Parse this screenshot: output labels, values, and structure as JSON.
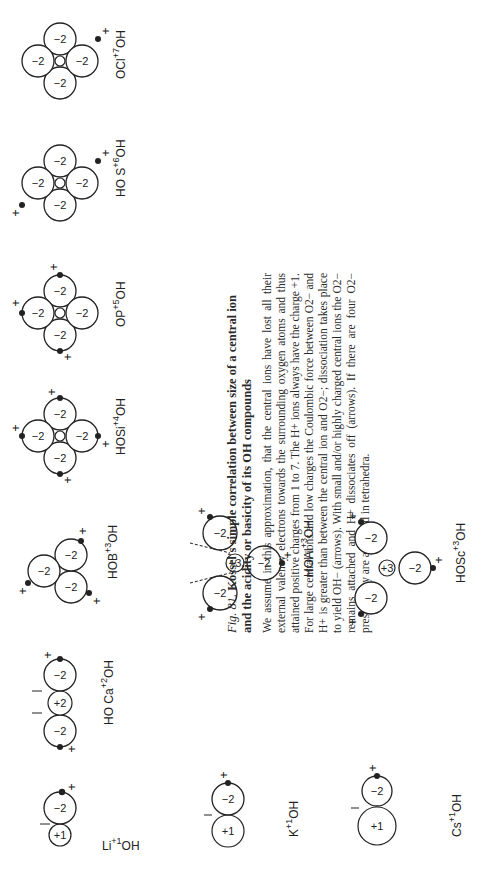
{
  "figure": {
    "label": "Fig. 81.",
    "title": "Kossel's simple correlation between size of a central ion and the acidity or basicity of its OH compounds",
    "body": "We assume in this approximation, that the central ions have lost all their external valency electrons towards the surrounding oxygen atoms and thus attained positive charges from 1 to 7. The H+ ions always have the charge +1. For large central ions and low charges the Coulombic force between O2− and H+ is greater than between the central ion and O2−; dissociation takes place to yield OH− (arrows). With small and/or highly charged central ions the O2− remains attached and H+ dissociates off (arrows). If there are four O2− present they are arranged in tetrahedra."
  },
  "molecules": [
    {
      "id": "li",
      "formula": "Li",
      "charge": "+1",
      "suffix": "OH",
      "central_charge": "+1",
      "oxygen_charge": "−2"
    },
    {
      "id": "ca",
      "formula": "HO Ca",
      "charge": "+2",
      "suffix": "OH",
      "central_charge": "+2",
      "oxygen_charge": "−2"
    },
    {
      "id": "b",
      "formula": "HO B(OH) OH",
      "charge": "+3",
      "central_charge": "+3",
      "oxygen_charge": "−2"
    },
    {
      "id": "si",
      "formula": "HO Si(OH)2 OH",
      "charge": "+4",
      "central_charge": "+4",
      "oxygen_charge": "−2"
    },
    {
      "id": "p",
      "formula": "O P(OH)3",
      "charge": "+5",
      "central_charge": "+5",
      "oxygen_charge": "−2"
    },
    {
      "id": "s",
      "formula": "HO S(O)2 OH",
      "charge": "+6",
      "central_charge": "+6",
      "oxygen_charge": "−2"
    },
    {
      "id": "cl",
      "formula": "O Cl(O)2 OH",
      "charge": "+7",
      "central_charge": "+7",
      "oxygen_charge": "−2"
    },
    {
      "id": "k",
      "formula": "K",
      "charge": "+1",
      "suffix": "OH",
      "central_charge": "+1",
      "oxygen_charge": "−2"
    },
    {
      "id": "al",
      "formula": "HO Al(OH) OH",
      "charge": "+3",
      "central_charge": "+3",
      "oxygen_charge": "−2"
    },
    {
      "id": "cs",
      "formula": "Cs",
      "charge": "+1",
      "suffix": "OH",
      "central_charge": "+1",
      "oxygen_charge": "−2"
    },
    {
      "id": "sc",
      "formula": "HO Sc(OH) OH",
      "charge": "+3",
      "central_charge": "+3",
      "oxygen_charge": "−2"
    }
  ],
  "labels": {
    "o": "O",
    "h": "H",
    "oh": "OH",
    "ho": "HO",
    "plus": "+",
    "minus2": "−2",
    "li": "Li",
    "ca": "Ca",
    "b": "B",
    "si": "Si",
    "p": "P",
    "s": "S",
    "cl": "Cl",
    "k": "K",
    "al": "Al",
    "cs": "Cs",
    "sc": "Sc",
    "c1": "+1",
    "c2": "+2",
    "c3": "+3",
    "c4": "+4",
    "c5": "+5",
    "c6": "+6",
    "c7": "+7"
  }
}
